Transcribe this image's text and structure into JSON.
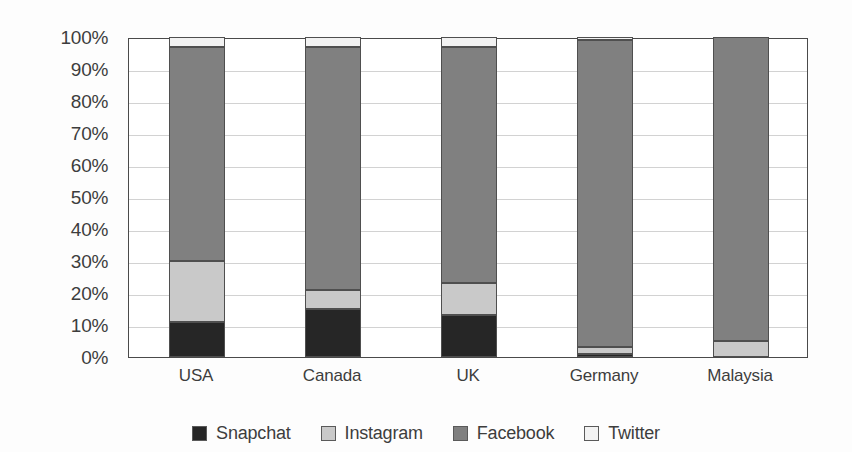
{
  "chart_data": {
    "type": "bar",
    "subtype": "stacked-100-percent",
    "title": "",
    "xlabel": "",
    "ylabel": "",
    "ylim": [
      0,
      100
    ],
    "ytick_labels": [
      "0%",
      "10%",
      "20%",
      "30%",
      "40%",
      "50%",
      "60%",
      "70%",
      "80%",
      "90%",
      "100%"
    ],
    "ytick_values": [
      0,
      10,
      20,
      30,
      40,
      50,
      60,
      70,
      80,
      90,
      100
    ],
    "grid": true,
    "grid_axis": "y",
    "legend_position": "bottom",
    "categories": [
      "USA",
      "Canada",
      "UK",
      "Germany",
      "Malaysia"
    ],
    "series": [
      {
        "name": "Snapchat",
        "color": "#262626",
        "values": [
          11,
          15,
          13,
          1,
          0
        ]
      },
      {
        "name": "Instagram",
        "color": "#c9c9c9",
        "values": [
          19,
          6,
          10,
          2,
          5
        ]
      },
      {
        "name": "Facebook",
        "color": "#808080",
        "values": [
          67,
          76,
          74,
          96,
          95
        ]
      },
      {
        "name": "Twitter",
        "color": "#f2f2f2",
        "values": [
          3,
          3,
          3,
          1,
          0
        ]
      }
    ]
  },
  "legend": {
    "items": [
      {
        "label": "Snapchat",
        "color": "#262626"
      },
      {
        "label": "Instagram",
        "color": "#c9c9c9"
      },
      {
        "label": "Facebook",
        "color": "#808080"
      },
      {
        "label": "Twitter",
        "color": "#f2f2f2"
      }
    ]
  }
}
